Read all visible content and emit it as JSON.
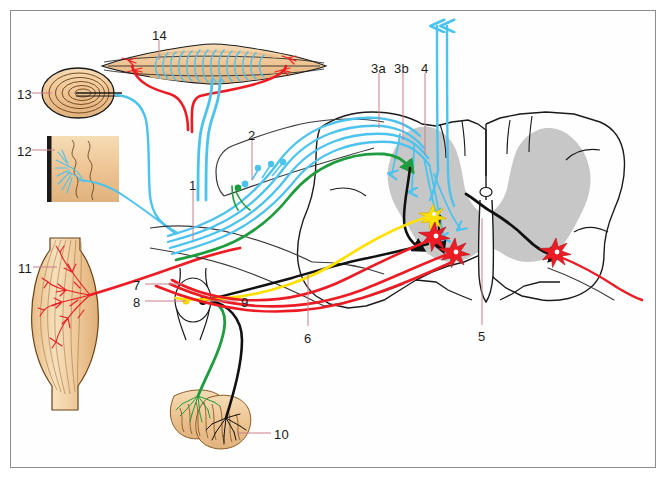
{
  "figure": {
    "type": "anatomical-diagram",
    "frame_color": "#8d8d90",
    "background_color": "#ffffff"
  },
  "palette": {
    "sensory_blue": "#4cc3ef",
    "interneuron_green": "#1f9c3d",
    "alpha_motor_red": "#ed1c24",
    "gamma_motor_yellow": "#ffe000",
    "descending_black": "#111111",
    "gray_matter": "#c4c4c4",
    "tissue_tan": "#f0ca97",
    "outline_black": "#1a1a1a",
    "leader_line": "#c97f87"
  },
  "labels": [
    {
      "id": "1",
      "text": "1",
      "x": 189,
      "y": 179,
      "leader": {
        "x1": 193,
        "y1": 190,
        "x2": 193,
        "y2": 240
      }
    },
    {
      "id": "2",
      "text": "2",
      "x": 248,
      "y": 129,
      "leader": {
        "x1": 252,
        "y1": 140,
        "x2": 252,
        "y2": 180
      }
    },
    {
      "id": "3a",
      "text": "3a",
      "x": 371,
      "y": 62,
      "leader": {
        "x1": 379,
        "y1": 73,
        "x2": 379,
        "y2": 128
      }
    },
    {
      "id": "3b",
      "text": "3b",
      "x": 394,
      "y": 62,
      "leader": {
        "x1": 403,
        "y1": 73,
        "x2": 403,
        "y2": 140
      }
    },
    {
      "id": "4",
      "text": "4",
      "x": 421,
      "y": 62,
      "leader": {
        "x1": 425,
        "y1": 73,
        "x2": 425,
        "y2": 155
      }
    },
    {
      "id": "5",
      "text": "5",
      "x": 478,
      "y": 330,
      "leader": {
        "x1": 482,
        "y1": 325,
        "x2": 482,
        "y2": 218
      }
    },
    {
      "id": "6",
      "text": "6",
      "x": 304,
      "y": 332,
      "leader": {
        "x1": 308,
        "y1": 326,
        "x2": 308,
        "y2": 275
      }
    },
    {
      "id": "7",
      "text": "7",
      "x": 133,
      "y": 279,
      "leader": {
        "x1": 145,
        "y1": 284,
        "x2": 182,
        "y2": 284
      }
    },
    {
      "id": "8",
      "text": "8",
      "x": 133,
      "y": 296,
      "leader": {
        "x1": 145,
        "y1": 301,
        "x2": 186,
        "y2": 301
      }
    },
    {
      "id": "9",
      "text": "9",
      "x": 241,
      "y": 296,
      "leader": {
        "x1": 238,
        "y1": 301,
        "x2": 206,
        "y2": 301
      }
    },
    {
      "id": "10",
      "text": "10",
      "x": 274,
      "y": 428,
      "leader": {
        "x1": 271,
        "y1": 433,
        "x2": 237,
        "y2": 433
      }
    },
    {
      "id": "11",
      "text": "11",
      "x": 18,
      "y": 262,
      "leader": {
        "x1": 33,
        "y1": 267,
        "x2": 57,
        "y2": 267
      }
    },
    {
      "id": "12",
      "text": "12",
      "x": 17,
      "y": 145,
      "leader": {
        "x1": 32,
        "y1": 150,
        "x2": 55,
        "y2": 150
      }
    },
    {
      "id": "13",
      "text": "13",
      "x": 17,
      "y": 88,
      "leader": {
        "x1": 32,
        "y1": 93,
        "x2": 52,
        "y2": 93
      }
    },
    {
      "id": "14",
      "text": "14",
      "x": 152,
      "y": 29,
      "leader": {
        "x1": 159,
        "y1": 40,
        "x2": 159,
        "y2": 60
      }
    }
  ],
  "structures": {
    "muscle_spindle": "muscle-spindle-14",
    "pacinian_corpuscle": "pacinian-corpuscle-13",
    "free_nerve_endings": "free-nerve-endings-skin-12",
    "skeletal_muscle": "skeletal-muscle-motor-endplate-11",
    "golgi_tendon_organ": "golgi-tendon-organ-10",
    "dorsal_root_ganglion": "dorsal-root-ganglion-9",
    "spinal_cord": "spinal-cord-cross-section",
    "central_canal": "central-canal-5",
    "ventral_root": "ventral-root-6",
    "dorsal_root": "dorsal-root"
  }
}
